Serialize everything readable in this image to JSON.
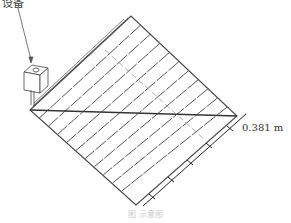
{
  "figure": {
    "top_label": "设备",
    "dimension_label": "0.381 m",
    "caption": "图 示意图"
  },
  "colors": {
    "line": "#444444",
    "dashed": "#999999",
    "background": "#ffffff"
  },
  "geometry": {
    "grid_corners": {
      "top": [
        131,
        16
      ],
      "left": [
        30,
        110
      ],
      "right": [
        237,
        116
      ],
      "bottom": [
        136,
        205
      ]
    },
    "pipe_count": 10,
    "device_box": {
      "x": 24,
      "y": 63,
      "w": 24,
      "h": 30
    }
  }
}
